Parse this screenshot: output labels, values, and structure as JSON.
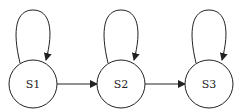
{
  "diagram": {
    "type": "state-machine",
    "states": [
      {
        "id": "S1",
        "label": "S1",
        "cx": 33,
        "cy": 84,
        "r": 24,
        "self_loop": true
      },
      {
        "id": "S2",
        "label": "S2",
        "cx": 121,
        "cy": 84,
        "r": 24,
        "self_loop": true
      },
      {
        "id": "S3",
        "label": "S3",
        "cx": 209,
        "cy": 84,
        "r": 24,
        "self_loop": true
      }
    ],
    "transitions": [
      {
        "from": "S1",
        "to": "S1"
      },
      {
        "from": "S1",
        "to": "S2"
      },
      {
        "from": "S2",
        "to": "S2"
      },
      {
        "from": "S2",
        "to": "S3"
      },
      {
        "from": "S3",
        "to": "S3"
      }
    ],
    "colors": {
      "stroke": "#222222",
      "fill": "#ffffff"
    }
  }
}
